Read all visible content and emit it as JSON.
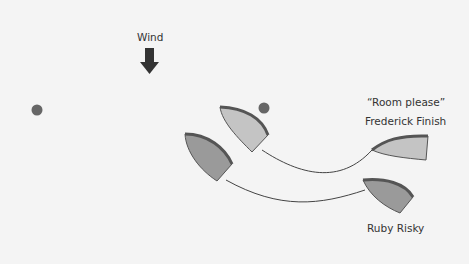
{
  "wind": {
    "label": "Wind",
    "direction": "down",
    "icon": "arrow-down-icon"
  },
  "labels": {
    "quote": "“Room please”",
    "frederick": "Frederick Finish",
    "ruby": "Ruby Risky"
  },
  "colors": {
    "background": "#f4f4f4",
    "boat_light": "#c4c4c4",
    "boat_dark": "#9a9a9a",
    "gunwale": "#555555",
    "mark": "#666666",
    "track": "#444444",
    "arrow": "#333333"
  },
  "marks": [
    {
      "name": "left-mark"
    },
    {
      "name": "center-mark"
    }
  ]
}
